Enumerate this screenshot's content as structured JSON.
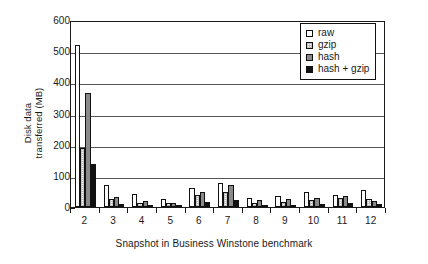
{
  "chart_data": {
    "type": "bar",
    "title": "",
    "xlabel": "Snapshot in Business Winstone benchmark",
    "ylabel": "Disk data\ntransferred (MB)",
    "ylabel_line1": "Disk data",
    "ylabel_line2": "transferred (MB)",
    "categories": [
      "2",
      "3",
      "4",
      "5",
      "6",
      "7",
      "8",
      "9",
      "10",
      "11",
      "12"
    ],
    "ylim": [
      0,
      600
    ],
    "yticks": [
      0,
      100,
      200,
      300,
      400,
      500,
      600
    ],
    "ytick_labels": [
      "0",
      "100",
      "200",
      "300",
      "400",
      "500",
      "600"
    ],
    "grid": "horizontal",
    "legend_position": "top-right",
    "series": [
      {
        "name": "raw",
        "fill": "white",
        "color": "#ffffff",
        "values": [
          520,
          70,
          42,
          27,
          62,
          78,
          30,
          34,
          47,
          40,
          54
        ]
      },
      {
        "name": "gzip",
        "fill": "light-stipple",
        "color": "#cfcfcf",
        "values": [
          190,
          25,
          13,
          12,
          38,
          48,
          14,
          16,
          23,
          30,
          25
        ]
      },
      {
        "name": "hash",
        "fill": "gray",
        "color": "#8a8a8a",
        "values": [
          365,
          32,
          18,
          14,
          47,
          72,
          21,
          26,
          30,
          34,
          19
        ]
      },
      {
        "name": "hash + gzip",
        "fill": "black",
        "color": "#111111",
        "values": [
          138,
          10,
          7,
          6,
          15,
          22,
          8,
          8,
          10,
          12,
          9
        ]
      }
    ]
  },
  "legend": {
    "items": [
      {
        "label": "raw"
      },
      {
        "label": "gzip"
      },
      {
        "label": "hash"
      },
      {
        "label": "hash + gzip"
      }
    ]
  }
}
